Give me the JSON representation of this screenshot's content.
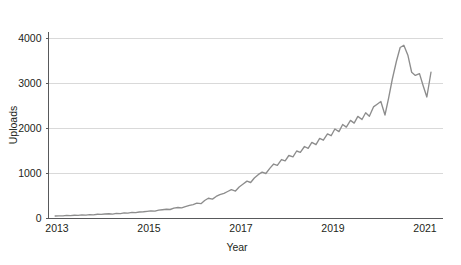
{
  "chart_data": {
    "type": "line",
    "title": "",
    "xlabel": "Year",
    "ylabel": "Uploads",
    "xlim": [
      2012.92,
      2021.3
    ],
    "ylim": [
      0,
      4350
    ],
    "grid": true,
    "legend": false,
    "legend_position": "none",
    "line_color": "#8d8d8d",
    "axis_color": "#58595b",
    "grid_color": "#d9d9d9",
    "background_color": "#ffffff",
    "x_ticks": [
      2013,
      2015,
      2017,
      2019,
      2021
    ],
    "x_tick_labels": [
      "2013",
      "2015",
      "2017",
      "2019",
      "2021"
    ],
    "y_ticks": [
      0,
      1000,
      2000,
      3000,
      4000
    ],
    "y_tick_labels": [
      "0",
      "1000",
      "2000",
      "3000",
      "4000"
    ],
    "series": [
      {
        "name": "Uploads",
        "x": [
          2012.96,
          2013.04,
          2013.13,
          2013.21,
          2013.29,
          2013.38,
          2013.46,
          2013.54,
          2013.63,
          2013.71,
          2013.79,
          2013.88,
          2013.96,
          2014.04,
          2014.13,
          2014.21,
          2014.29,
          2014.38,
          2014.46,
          2014.54,
          2014.63,
          2014.71,
          2014.79,
          2014.88,
          2014.96,
          2015.04,
          2015.13,
          2015.21,
          2015.29,
          2015.38,
          2015.46,
          2015.54,
          2015.63,
          2015.71,
          2015.79,
          2015.88,
          2015.96,
          2016.04,
          2016.13,
          2016.21,
          2016.29,
          2016.38,
          2016.46,
          2016.54,
          2016.63,
          2016.71,
          2016.79,
          2016.88,
          2016.96,
          2017.04,
          2017.13,
          2017.21,
          2017.29,
          2017.38,
          2017.46,
          2017.54,
          2017.63,
          2017.71,
          2017.79,
          2017.88,
          2017.96,
          2018.04,
          2018.13,
          2018.21,
          2018.29,
          2018.38,
          2018.46,
          2018.54,
          2018.63,
          2018.71,
          2018.79,
          2018.88,
          2018.96,
          2019.04,
          2019.13,
          2019.21,
          2019.29,
          2019.38,
          2019.46,
          2019.54,
          2019.63,
          2019.71,
          2019.79,
          2019.88,
          2019.96,
          2020.04,
          2020.13,
          2020.21,
          2020.29,
          2020.38,
          2020.46,
          2020.54,
          2020.63,
          2020.71,
          2020.79,
          2020.88,
          2020.96,
          2021.04,
          2021.13
        ],
        "values": [
          55,
          60,
          58,
          70,
          65,
          72,
          68,
          80,
          75,
          85,
          82,
          95,
          90,
          100,
          105,
          98,
          115,
          110,
          125,
          120,
          135,
          130,
          145,
          150,
          160,
          170,
          165,
          185,
          195,
          205,
          200,
          230,
          245,
          235,
          265,
          290,
          310,
          340,
          330,
          400,
          450,
          430,
          490,
          530,
          560,
          600,
          640,
          610,
          700,
          760,
          830,
          800,
          900,
          980,
          1030,
          1000,
          1120,
          1210,
          1180,
          1310,
          1280,
          1400,
          1370,
          1500,
          1470,
          1600,
          1560,
          1690,
          1640,
          1780,
          1740,
          1880,
          1840,
          1990,
          1930,
          2090,
          2030,
          2180,
          2120,
          2270,
          2200,
          2350,
          2270,
          2480,
          2540,
          2600,
          2300,
          2680,
          3100,
          3500,
          3800,
          3850,
          3620,
          3250,
          3180,
          3220,
          2950,
          2700,
          3250
        ]
      }
    ]
  }
}
